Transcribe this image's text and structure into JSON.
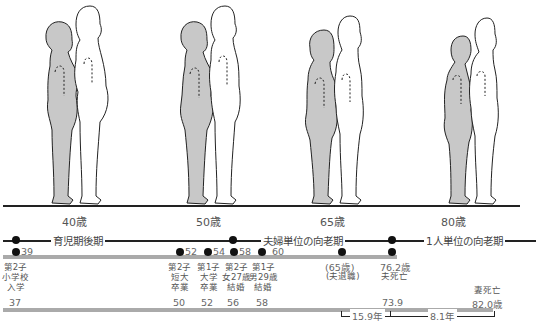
{
  "figures": [
    {
      "age_label": "40歳",
      "x": 28
    },
    {
      "age_label": "50歳",
      "x": 168
    },
    {
      "age_label": "65歳",
      "x": 300
    },
    {
      "age_label": "80歳",
      "x": 435
    }
  ],
  "phases": {
    "phase1": "育児期後期",
    "phase2": "夫婦単位の向老期",
    "phase3": "1人単位の向老期"
  },
  "husband_track": {
    "markers": [
      {
        "value": "39"
      },
      {
        "value": "52"
      },
      {
        "value": "54"
      },
      {
        "value": "58"
      },
      {
        "value": "60"
      },
      {
        "value": "(65歳)"
      },
      {
        "value": "76.2歳"
      }
    ],
    "events": [
      {
        "label": "第2子\n小学校\n入学"
      },
      {
        "label": "第2子\n短大\n卒業"
      },
      {
        "label": "第1子\n大学\n卒業"
      },
      {
        "label": "第2子\n女27歳\n結婚"
      },
      {
        "label": "第1子\n男29歳\n結婚"
      },
      {
        "label": "(夫退職)"
      },
      {
        "label": "夫死亡"
      }
    ]
  },
  "wife_track": {
    "ages": [
      "37",
      "50",
      "52",
      "56",
      "58",
      "73.9",
      "82.0歳"
    ],
    "death_label": "妻死亡"
  },
  "durations": {
    "first": "15.9年",
    "second": "8.1年"
  },
  "colors": {
    "wife_fill": "#c8c8c8",
    "outline": "#222222",
    "bar": "#aaaaaa"
  }
}
